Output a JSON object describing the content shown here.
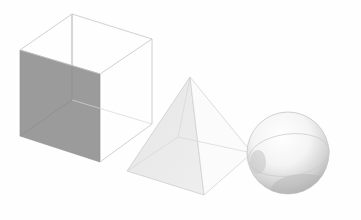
{
  "diagram": {
    "title": "",
    "background_color": "#fefefe",
    "shapes": [
      {
        "id": "cube",
        "label": "",
        "type": "cube",
        "edge_color": "#c4c4c4",
        "shaded_face_color": "#9b9b9b",
        "vertices": {
          "back_top": [
            72,
            14
          ],
          "right_top": [
            152,
            39
          ],
          "front_top": [
            100,
            74
          ],
          "left_top": [
            20,
            50
          ],
          "back_bottom": [
            72,
            100
          ],
          "right_bottom": [
            152,
            124
          ],
          "front_bottom": [
            100,
            162
          ],
          "left_bottom": [
            20,
            136
          ]
        },
        "shaded_face": "front-left"
      },
      {
        "id": "pyramid",
        "label": "",
        "type": "square-pyramid",
        "edge_color": "#c8c8c8",
        "fill_color": "#ececec",
        "vertices": {
          "apex": [
            190,
            77
          ],
          "base_back": [
            178,
            137
          ],
          "base_left": [
            127,
            171
          ],
          "base_front": [
            204,
            195
          ],
          "base_right": [
            252,
            153
          ]
        }
      },
      {
        "id": "sphere",
        "label": "",
        "type": "sphere",
        "center": [
          288,
          153
        ],
        "radius": 41,
        "edge_color": "#c0c0c0",
        "highlight_color": "#ffffff",
        "shadow_color": "#9e9e9e",
        "equator": "tilted ellipse"
      }
    ]
  }
}
